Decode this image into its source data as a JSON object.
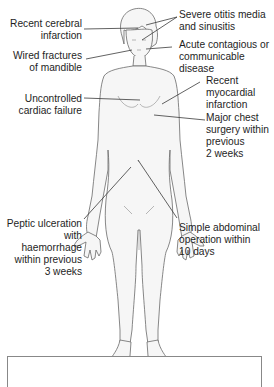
{
  "diagram": {
    "type": "anatomical-contraindications",
    "line_color": "#3a3a3a",
    "body_fill": "#f6f6f6",
    "body_stroke": "#6a6a6a",
    "labels_left": [
      {
        "id": "cerebral",
        "lines": [
          "Recent cerebral",
          "infarction"
        ]
      },
      {
        "id": "mandible",
        "lines": [
          "Wired fractures",
          "of mandible"
        ]
      },
      {
        "id": "cardiac",
        "lines": [
          "Uncontrolled",
          "cardiac failure"
        ]
      },
      {
        "id": "peptic",
        "lines": [
          "Peptic ulceration",
          "with haemorrhage",
          "within previous",
          "3 weeks"
        ]
      }
    ],
    "labels_right": [
      {
        "id": "otitis",
        "lines": [
          "Severe otitis media",
          "and sinusitis"
        ]
      },
      {
        "id": "contagious",
        "lines": [
          "Acute contagious or",
          "communicable",
          "disease"
        ]
      },
      {
        "id": "myocardial",
        "lines": [
          "Recent",
          "myocardial",
          "infarction"
        ]
      },
      {
        "id": "chest",
        "lines": [
          "Major chest",
          "surgery within",
          "previous",
          "2 weeks"
        ]
      },
      {
        "id": "abdominal",
        "lines": [
          "Simple abdominal",
          "operation within",
          "10 days"
        ]
      }
    ]
  }
}
